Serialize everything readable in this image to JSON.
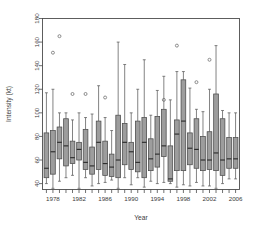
{
  "chart_data": {
    "type": "box",
    "title": "",
    "xlabel": "Year",
    "ylabel": "Intensity (kt)",
    "ylim": [
      35,
      180
    ],
    "yticks": [
      40,
      60,
      80,
      100,
      120,
      140,
      160,
      180
    ],
    "ytick_labels": [
      "40",
      "60",
      "80",
      "100",
      "120",
      "140",
      "160",
      "180"
    ],
    "xlim": [
      1976.4,
      2006.6
    ],
    "xticks": [
      1977,
      1978,
      1979,
      1980,
      1981,
      1982,
      1983,
      1984,
      1985,
      1986,
      1987,
      1988,
      1989,
      1990,
      1991,
      1992,
      1993,
      1994,
      1995,
      1996,
      1997,
      1998,
      1999,
      2000,
      2001,
      2002,
      2003,
      2004,
      2005,
      2006
    ],
    "xtick_labels": [
      "1978",
      "1982",
      "1986",
      "1990",
      "1994",
      "1998",
      "2002",
      "2006"
    ],
    "xtick_label_values": [
      1978,
      1982,
      1986,
      1990,
      1994,
      1998,
      2002,
      2006
    ],
    "grid": false,
    "legend": null,
    "categories": [
      1977,
      1978,
      1979,
      1980,
      1981,
      1982,
      1983,
      1984,
      1985,
      1986,
      1987,
      1988,
      1989,
      1990,
      1991,
      1992,
      1993,
      1994,
      1995,
      1996,
      1997,
      1998,
      1999,
      2000,
      2001,
      2002,
      2003,
      2004,
      2005,
      2006
    ],
    "boxes": [
      {
        "x": 1977,
        "whisker_low": 40,
        "q1": 45,
        "median": 53,
        "q3": 83,
        "whisker_high": 117,
        "outliers": []
      },
      {
        "x": 1978,
        "whisker_low": 36,
        "q1": 48,
        "median": 67,
        "q3": 85,
        "whisker_high": 120,
        "outliers": [
          151
        ]
      },
      {
        "x": 1979,
        "whisker_low": 42,
        "q1": 61,
        "median": 75,
        "q3": 88,
        "whisker_high": 100,
        "outliers": [
          165
        ]
      },
      {
        "x": 1980,
        "whisker_low": 45,
        "q1": 55,
        "median": 72,
        "q3": 95,
        "whisker_high": 100,
        "outliers": []
      },
      {
        "x": 1981,
        "whisker_low": 47,
        "q1": 57,
        "median": 62,
        "q3": 76,
        "whisker_high": 94,
        "outliers": [
          116
        ]
      },
      {
        "x": 1982,
        "whisker_low": 36,
        "q1": 60,
        "median": 69,
        "q3": 75,
        "whisker_high": 100,
        "outliers": []
      },
      {
        "x": 1983,
        "whisker_low": 45,
        "q1": 52,
        "median": 58,
        "q3": 86,
        "whisker_high": 96,
        "outliers": [
          116
        ]
      },
      {
        "x": 1984,
        "whisker_low": 38,
        "q1": 48,
        "median": 55,
        "q3": 71,
        "whisker_high": 99,
        "outliers": []
      },
      {
        "x": 1985,
        "whisker_low": 40,
        "q1": 52,
        "median": 75,
        "q3": 93,
        "whisker_high": 123,
        "outliers": []
      },
      {
        "x": 1986,
        "whisker_low": 41,
        "q1": 47,
        "median": 57,
        "q3": 76,
        "whisker_high": 96,
        "outliers": [
          113
        ]
      },
      {
        "x": 1987,
        "whisker_low": 43,
        "q1": 46,
        "median": 54,
        "q3": 65,
        "whisker_high": 85,
        "outliers": []
      },
      {
        "x": 1988,
        "whisker_low": 36,
        "q1": 45,
        "median": 60,
        "q3": 98,
        "whisker_high": 160,
        "outliers": []
      },
      {
        "x": 1989,
        "whisker_low": 45,
        "q1": 56,
        "median": 75,
        "q3": 91,
        "whisker_high": 141,
        "outliers": []
      },
      {
        "x": 1990,
        "whisker_low": 39,
        "q1": 52,
        "median": 67,
        "q3": 75,
        "whisker_high": 100,
        "outliers": []
      },
      {
        "x": 1991,
        "whisker_low": 45,
        "q1": 50,
        "median": 58,
        "q3": 93,
        "whisker_high": 120,
        "outliers": []
      },
      {
        "x": 1992,
        "whisker_low": 37,
        "q1": 45,
        "median": 75,
        "q3": 96,
        "whisker_high": 145,
        "outliers": []
      },
      {
        "x": 1993,
        "whisker_low": 42,
        "q1": 51,
        "median": 61,
        "q3": 78,
        "whisker_high": 98,
        "outliers": []
      },
      {
        "x": 1994,
        "whisker_low": 40,
        "q1": 54,
        "median": 65,
        "q3": 97,
        "whisker_high": 119,
        "outliers": []
      },
      {
        "x": 1995,
        "whisker_low": 41,
        "q1": 63,
        "median": 72,
        "q3": 103,
        "whisker_high": 131,
        "outliers": [
          111
        ]
      },
      {
        "x": 1996,
        "whisker_low": 40,
        "q1": 42,
        "median": 44,
        "q3": 72,
        "whisker_high": 111,
        "outliers": []
      },
      {
        "x": 1997,
        "whisker_low": 37,
        "q1": 51,
        "median": 82,
        "q3": 94,
        "whisker_high": 135,
        "outliers": [
          157
        ]
      },
      {
        "x": 1998,
        "whisker_low": 39,
        "q1": 51,
        "median": 93,
        "q3": 128,
        "whisker_high": 135,
        "outliers": []
      },
      {
        "x": 1999,
        "whisker_low": 38,
        "q1": 56,
        "median": 70,
        "q3": 83,
        "whisker_high": 121,
        "outliers": []
      },
      {
        "x": 2000,
        "whisker_low": 41,
        "q1": 53,
        "median": 69,
        "q3": 95,
        "whisker_high": 103,
        "outliers": [
          126
        ]
      },
      {
        "x": 2001,
        "whisker_low": 38,
        "q1": 51,
        "median": 60,
        "q3": 80,
        "whisker_high": 101,
        "outliers": []
      },
      {
        "x": 2002,
        "whisker_low": 38,
        "q1": 52,
        "median": 60,
        "q3": 84,
        "whisker_high": 120,
        "outliers": [
          145
        ]
      },
      {
        "x": 2003,
        "whisker_low": 36,
        "q1": 51,
        "median": 66,
        "q3": 116,
        "whisker_high": 157,
        "outliers": []
      },
      {
        "x": 2004,
        "whisker_low": 40,
        "q1": 47,
        "median": 60,
        "q3": 95,
        "whisker_high": 102,
        "outliers": []
      },
      {
        "x": 2005,
        "whisker_low": 44,
        "q1": 53,
        "median": 61,
        "q3": 79,
        "whisker_high": 100,
        "outliers": []
      },
      {
        "x": 2006,
        "whisker_low": 44,
        "q1": 53,
        "median": 61,
        "q3": 79,
        "whisker_high": 100,
        "outliers": []
      }
    ]
  }
}
